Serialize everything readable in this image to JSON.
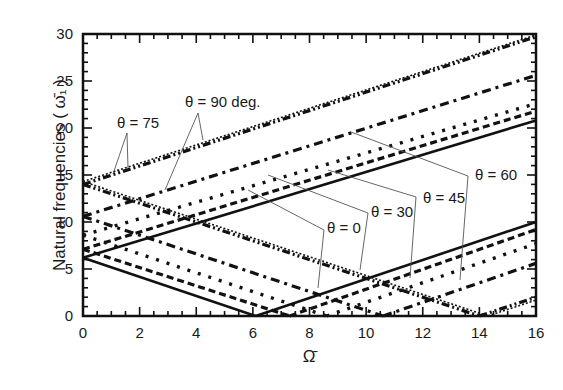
{
  "chart_data": {
    "type": "line",
    "title": "",
    "xlabel": "Ω̄",
    "ylabel": "Natural frequencies ( ω̄₁ )",
    "xlim": [
      0,
      16
    ],
    "ylim": [
      0,
      30
    ],
    "xticks": [
      "0",
      "2",
      "4",
      "6",
      "8",
      "10",
      "12",
      "14",
      "16"
    ],
    "yticks": [
      "0",
      "5",
      "10",
      "15",
      "20",
      "25",
      "30"
    ],
    "grid": false,
    "legend": "none (inline annotations)",
    "annotations": [
      "θ = 90 deg.",
      "θ = 75",
      "θ = 60",
      "θ = 45",
      "θ = 30",
      "θ = 0"
    ],
    "series": [
      {
        "name": "θ = 0",
        "style": "solid",
        "segments": [
          {
            "x": [
              0,
              16
            ],
            "y": [
              6.2,
              20.8
            ]
          },
          {
            "x": [
              0,
              6.1
            ],
            "y": [
              6.2,
              0
            ]
          },
          {
            "x": [
              6.1,
              16
            ],
            "y": [
              0,
              10.0
            ]
          }
        ]
      },
      {
        "name": "θ = 30",
        "style": "dashed",
        "segments": [
          {
            "x": [
              0,
              16
            ],
            "y": [
              7.1,
              21.8
            ]
          },
          {
            "x": [
              0,
              7.3
            ],
            "y": [
              7.1,
              0
            ]
          },
          {
            "x": [
              7.3,
              16
            ],
            "y": [
              0,
              9.2
            ]
          }
        ]
      },
      {
        "name": "θ = 45",
        "style": "dotted",
        "segments": [
          {
            "x": [
              0,
              16
            ],
            "y": [
              8.6,
              22.6
            ]
          },
          {
            "x": [
              0,
              8.6
            ],
            "y": [
              8.6,
              0
            ]
          },
          {
            "x": [
              8.6,
              16
            ],
            "y": [
              0,
              7.7
            ]
          }
        ]
      },
      {
        "name": "θ = 60",
        "style": "dash-dot",
        "segments": [
          {
            "x": [
              0,
              16
            ],
            "y": [
              10.6,
              25.6
            ]
          },
          {
            "x": [
              0,
              10.6
            ],
            "y": [
              10.6,
              0
            ]
          },
          {
            "x": [
              10.6,
              16
            ],
            "y": [
              0,
              5.6
            ]
          }
        ]
      },
      {
        "name": "θ = 75",
        "style": "dash-dot-dot",
        "segments": [
          {
            "x": [
              0,
              16
            ],
            "y": [
              14.0,
              29.7
            ]
          },
          {
            "x": [
              0,
              14.0
            ],
            "y": [
              14.0,
              0
            ]
          },
          {
            "x": [
              14.0,
              16
            ],
            "y": [
              0,
              2.0
            ]
          }
        ]
      },
      {
        "name": "θ = 90 deg.",
        "style": "dotted-thin",
        "segments": [
          {
            "x": [
              0,
              16
            ],
            "y": [
              14.3,
              29.9
            ]
          },
          {
            "x": [
              0,
              14.3
            ],
            "y": [
              14.3,
              0
            ]
          },
          {
            "x": [
              14.3,
              16
            ],
            "y": [
              0,
              1.7
            ]
          }
        ]
      }
    ]
  }
}
